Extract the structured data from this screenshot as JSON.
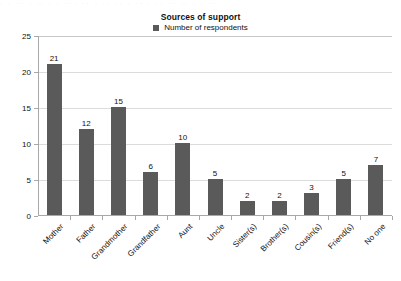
{
  "chart_data": {
    "type": "bar",
    "title": "Sources of support",
    "xlabel": "",
    "ylabel": "",
    "ylim": [
      0,
      25
    ],
    "yticks": [
      0,
      5,
      10,
      15,
      20,
      25
    ],
    "grid": true,
    "legend_position": "top-center",
    "legend": [
      "Number of respondents"
    ],
    "series_name": "Number of respondents",
    "series_color": "#5a5a5a",
    "categories": [
      "Mother",
      "Father",
      "Grandmother",
      "Grandfather",
      "Aunt",
      "Uncle",
      "Sister(s)",
      "Brother(s)",
      "Cousin(s)",
      "Friend(s)",
      "No one"
    ],
    "values": [
      21,
      12,
      15,
      6,
      10,
      5,
      2,
      2,
      3,
      5,
      7
    ],
    "data_labels": [
      "21",
      "12",
      "15",
      "6",
      "10",
      "5",
      "2",
      "2",
      "3",
      "5",
      "7"
    ],
    "ytick_labels": [
      "0",
      "5",
      "10",
      "15",
      "20",
      "25"
    ]
  },
  "legend_marker": "square-swatch-icon",
  "colors": {
    "bar": "#5a5a5a",
    "gridline": "#dcdcdc",
    "axis": "#a8a8a8",
    "text": "#111111",
    "background": "#ffffff"
  },
  "artifact_text": "· ·  ·· ·   ·· ·  ·  ··· ·· ·   ·· ·· ·  ·· ·   ·· ·· ·· ·  ·  ··"
}
